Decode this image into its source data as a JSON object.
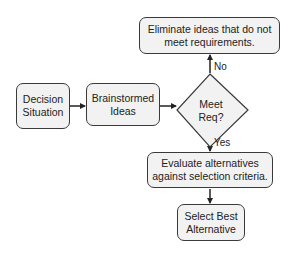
{
  "diagram": {
    "type": "flowchart",
    "nodes": {
      "decision_situation": {
        "label": "Decision\nSituation",
        "shape": "rounded-rectangle"
      },
      "brainstormed_ideas": {
        "label": "Brainstormed\nIdeas",
        "shape": "rounded-rectangle"
      },
      "meet_req": {
        "label": "Meet\nReq?",
        "shape": "diamond"
      },
      "eliminate": {
        "label": "Eliminate ideas that do not\nmeet requirements.",
        "shape": "rounded-rectangle"
      },
      "evaluate": {
        "label": "Evaluate alternatives\nagainst selection criteria.",
        "shape": "rounded-rectangle"
      },
      "select_best": {
        "label": "Select Best\nAlternative",
        "shape": "rounded-rectangle"
      }
    },
    "edges": [
      {
        "from": "decision_situation",
        "to": "brainstormed_ideas",
        "label": ""
      },
      {
        "from": "brainstormed_ideas",
        "to": "meet_req",
        "label": ""
      },
      {
        "from": "meet_req",
        "to": "eliminate",
        "label": "No"
      },
      {
        "from": "meet_req",
        "to": "evaluate",
        "label": "Yes"
      },
      {
        "from": "evaluate",
        "to": "select_best",
        "label": ""
      }
    ],
    "edge_labels": {
      "no": "No",
      "yes": "Yes"
    },
    "colors": {
      "node_fill": "#f2f2f2",
      "node_stroke": "#3a3a3a",
      "arrow": "#222222",
      "text": "#222222",
      "background": "#ffffff"
    }
  }
}
